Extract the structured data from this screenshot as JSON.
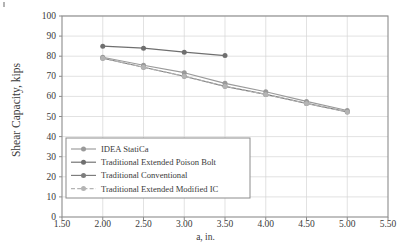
{
  "chart_data": {
    "type": "line",
    "title": "",
    "xlabel": "a, in.",
    "ylabel": "Shear Capacity, kips",
    "xlim": [
      1.5,
      5.5
    ],
    "ylim": [
      0,
      100
    ],
    "xticks": [
      "1.50",
      "2.00",
      "2.50",
      "3.00",
      "3.50",
      "4.00",
      "4.50",
      "5.00",
      "5.50"
    ],
    "yticks": [
      "0",
      "10",
      "20",
      "30",
      "40",
      "50",
      "60",
      "70",
      "80",
      "90",
      "100"
    ],
    "grid": true,
    "legend_position": "lower-left-inside",
    "x": [
      2.0,
      2.5,
      3.0,
      3.5,
      4.0,
      4.5,
      5.0
    ],
    "series": [
      {
        "name": "IDEA StatiCa",
        "color": "#9a9a9a",
        "style": "solid",
        "marker": "circle",
        "x": [
          2.0,
          2.5,
          3.0,
          3.5,
          4.0,
          4.5,
          5.0
        ],
        "values": [
          79.5,
          75.5,
          71.8,
          66.5,
          62.3,
          57.5,
          53.0
        ]
      },
      {
        "name": "Traditional Extended Poison Bolt",
        "color": "#6f6f6f",
        "style": "solid",
        "marker": "circle",
        "x": [
          2.0,
          2.5,
          3.0,
          3.5
        ],
        "values": [
          85.0,
          84.0,
          82.0,
          80.3
        ]
      },
      {
        "name": "Traditional Conventional",
        "color": "#7d7d7d",
        "style": "solid",
        "marker": "circle",
        "x": [
          2.0,
          2.5,
          3.0,
          3.5,
          4.0,
          4.5,
          5.0
        ],
        "values": [
          79.0,
          74.5,
          70.0,
          65.0,
          61.0,
          56.5,
          52.3
        ]
      },
      {
        "name": "Traditional Extended Modified IC",
        "color": "#b4b4b4",
        "style": "dashed",
        "marker": "circle",
        "x": [
          2.0,
          2.5,
          3.0,
          3.5,
          4.0,
          4.5,
          5.0
        ],
        "values": [
          79.0,
          74.5,
          70.0,
          65.0,
          61.0,
          56.5,
          52.3
        ]
      }
    ]
  },
  "axes": {
    "frame_color": "#8c8c8c",
    "grid_color": "#d6d6d6"
  },
  "legend": {
    "items": [
      "IDEA StatiCa",
      "Traditional Extended Poison Bolt",
      "Traditional Conventional",
      "Traditional Extended Modified IC"
    ]
  }
}
